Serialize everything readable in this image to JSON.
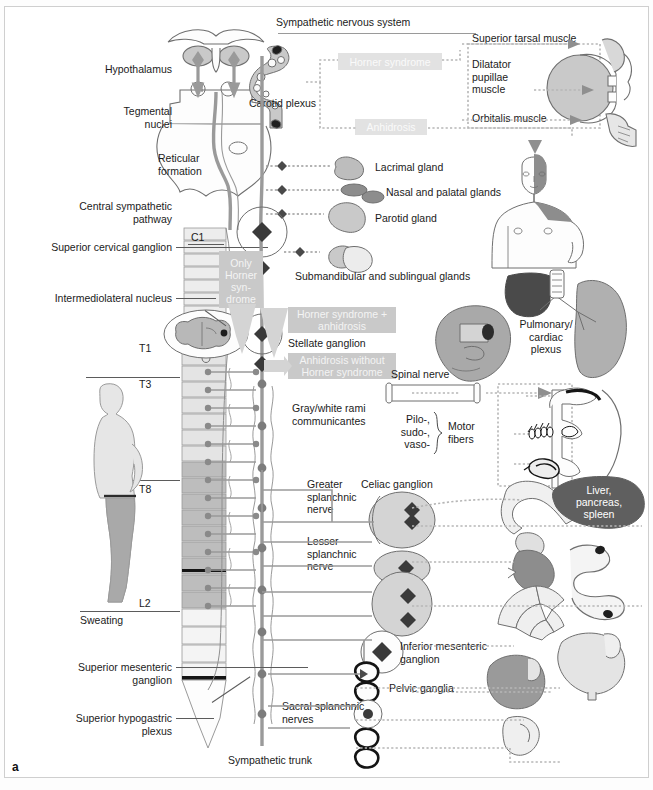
{
  "figure": {
    "panel_letter": "a",
    "title": "Sympathetic nervous system"
  },
  "colors": {
    "ink": "#1b1b1b",
    "line": "#5b5b5b",
    "pathway": "#9a9a9a",
    "organ_light": "#dcdcdc",
    "organ_mid": "#b4b4b4",
    "organ_dark": "#5f5f5f",
    "highlight_box": "#d4d4d4",
    "highlight_text": "#ffffff",
    "frame": "#cfcfcf",
    "background": "#ffffff"
  },
  "left_labels": [
    {
      "id": "hypothalamus",
      "text": "Hypothalamus"
    },
    {
      "id": "tegmental-nuclei",
      "text": "Tegmental\nnuclei"
    },
    {
      "id": "central-sympathetic-pathway",
      "text": "Central sympathetic\npathway"
    },
    {
      "id": "superior-cervical-ganglion",
      "text": "Superior cervical ganglion"
    },
    {
      "id": "intermediolateral-nucleus",
      "text": "Intermediolateral nucleus"
    },
    {
      "id": "superior-mesenteric-ganglion",
      "text": "Superior mesenteric\nganglion"
    },
    {
      "id": "superior-hypogastric-plexus",
      "text": "Superior hypogastric\nplexus"
    }
  ],
  "inline_labels": {
    "reticular_formation": "Reticular\nformation",
    "carotid_plexus": "Carotid plexus",
    "sweating": "Sweating",
    "stellate_ganglion": "Stellate ganglion",
    "spinal_nerve": "Spinal nerve",
    "gray_white_rami": "Gray/white rami\ncommunicantes",
    "pilo_sudo_vaso": "Pilo-,\nsudo-,\nvaso-",
    "motor_fibers": "Motor\nfibers",
    "greater_splanchnic": "Greater\nsplanchnic\nnerve",
    "lesser_splanchnic": "Lesser\nsplanchnic\nnerve",
    "celiac_ganglion": "Celiac ganglion",
    "inferior_mesenteric_ganglion": "Inferior mesenteric\nganglion",
    "pelvic_ganglia": "Pelvic ganglia",
    "sacral_splanchnic_nerves": "Sacral splanchnic\nnerves",
    "sympathetic_trunk": "Sympathetic trunk",
    "pulmonary_cardiac_plexus": "Pulmonary/\ncardiac\nplexus"
  },
  "target_organs": [
    {
      "id": "superior-tarsal-muscle",
      "text": "Superior tarsal muscle"
    },
    {
      "id": "dilatator-pupillae-muscle",
      "text": "Dilatator\npupillae\nmuscle"
    },
    {
      "id": "orbitalis-muscle",
      "text": "Orbitalis muscle"
    },
    {
      "id": "lacrimal-gland",
      "text": "Lacrimal gland"
    },
    {
      "id": "nasal-palatal-glands",
      "text": "Nasal and palatal glands"
    },
    {
      "id": "parotid-gland",
      "text": "Parotid gland"
    },
    {
      "id": "submandibular-sublingual-glands",
      "text": "Submandibular and sublingual glands"
    },
    {
      "id": "liver-pancreas-spleen",
      "text": "Liver,\npancreas,\nspleen"
    }
  ],
  "syndrome_boxes": [
    {
      "id": "horner-syndrome",
      "text": "Horner syndrome"
    },
    {
      "id": "anhidrosis",
      "text": "Anhidrosis"
    },
    {
      "id": "only-horner-syndrome",
      "text": "Only\nHorner\nsyn-\ndrome"
    },
    {
      "id": "horner-syndrome-plus-anhidrosis",
      "text": "Horner syndrome +\nanhidrosis"
    },
    {
      "id": "anhidrosis-without-horner-syndrome",
      "text": "Anhidrosis without\nHorner syndrome"
    }
  ],
  "spinal_levels": [
    {
      "id": "C1",
      "text": "C1"
    },
    {
      "id": "T1",
      "text": "T1"
    },
    {
      "id": "T3",
      "text": "T3"
    },
    {
      "id": "T8",
      "text": "T8"
    },
    {
      "id": "L2",
      "text": "L2"
    }
  ]
}
